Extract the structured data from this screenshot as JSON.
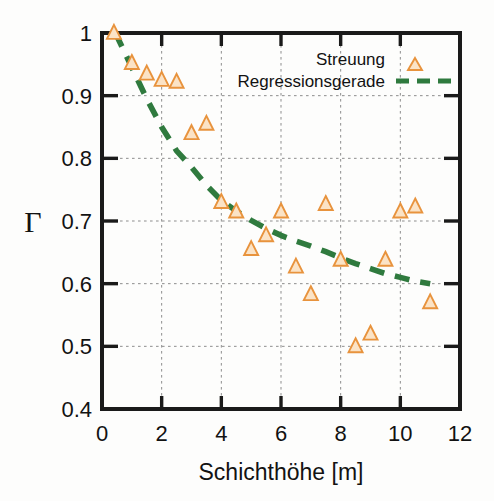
{
  "chart_data": {
    "type": "scatter",
    "title": "",
    "xlabel": "Schichthöhe [m]",
    "ylabel": "Γ",
    "xlim": [
      0,
      12
    ],
    "ylim": [
      0.4,
      1.0
    ],
    "xticks": [
      "0",
      "2",
      "4",
      "6",
      "8",
      "10",
      "12"
    ],
    "xtick_values": [
      0,
      2,
      4,
      6,
      8,
      10,
      12
    ],
    "yticks": [
      "0.4",
      "0.5",
      "0.6",
      "0.7",
      "0.8",
      "0.9",
      "1"
    ],
    "ytick_values": [
      0.4,
      0.5,
      0.6,
      0.7,
      0.8,
      0.9,
      1.0
    ],
    "grid": true,
    "grid_style": "dotted",
    "legend_position": "top-right",
    "series": [
      {
        "name": "Streuung",
        "type": "scatter",
        "marker": "triangle-up",
        "color": "#e8933d",
        "fill": "#fbe3c6",
        "points": [
          {
            "x": 0.4,
            "y": 1.0
          },
          {
            "x": 1.0,
            "y": 0.952
          },
          {
            "x": 1.5,
            "y": 0.935
          },
          {
            "x": 2.0,
            "y": 0.925
          },
          {
            "x": 2.5,
            "y": 0.922
          },
          {
            "x": 3.0,
            "y": 0.84
          },
          {
            "x": 3.5,
            "y": 0.855
          },
          {
            "x": 4.0,
            "y": 0.73
          },
          {
            "x": 4.5,
            "y": 0.715
          },
          {
            "x": 5.0,
            "y": 0.655
          },
          {
            "x": 5.5,
            "y": 0.677
          },
          {
            "x": 6.0,
            "y": 0.715
          },
          {
            "x": 6.5,
            "y": 0.627
          },
          {
            "x": 7.0,
            "y": 0.583
          },
          {
            "x": 7.5,
            "y": 0.727
          },
          {
            "x": 8.0,
            "y": 0.638
          },
          {
            "x": 8.5,
            "y": 0.5
          },
          {
            "x": 9.0,
            "y": 0.52
          },
          {
            "x": 9.5,
            "y": 0.638
          },
          {
            "x": 10.0,
            "y": 0.715
          },
          {
            "x": 10.5,
            "y": 0.723
          },
          {
            "x": 11.0,
            "y": 0.57
          }
        ]
      },
      {
        "name": "Regressionsgerade",
        "type": "line",
        "style": "dashed",
        "color": "#2f7a3e",
        "points": [
          {
            "x": 0.45,
            "y": 1.0
          },
          {
            "x": 1.0,
            "y": 0.945
          },
          {
            "x": 1.5,
            "y": 0.895
          },
          {
            "x": 2.0,
            "y": 0.85
          },
          {
            "x": 2.5,
            "y": 0.812
          },
          {
            "x": 3.0,
            "y": 0.786
          },
          {
            "x": 3.5,
            "y": 0.757
          },
          {
            "x": 4.0,
            "y": 0.733
          },
          {
            "x": 4.5,
            "y": 0.716
          },
          {
            "x": 5.0,
            "y": 0.701
          },
          {
            "x": 5.5,
            "y": 0.688
          },
          {
            "x": 6.0,
            "y": 0.677
          },
          {
            "x": 6.5,
            "y": 0.668
          },
          {
            "x": 7.0,
            "y": 0.66
          },
          {
            "x": 7.5,
            "y": 0.651
          },
          {
            "x": 8.0,
            "y": 0.641
          },
          {
            "x": 8.5,
            "y": 0.632
          },
          {
            "x": 9.0,
            "y": 0.624
          },
          {
            "x": 9.5,
            "y": 0.616
          },
          {
            "x": 10.0,
            "y": 0.61
          },
          {
            "x": 10.5,
            "y": 0.604
          },
          {
            "x": 11.0,
            "y": 0.6
          }
        ]
      }
    ]
  },
  "legend": {
    "entries": [
      {
        "label": "Streuung",
        "marker": "triangle-up"
      },
      {
        "label": "Regressionsgerade",
        "marker": "dashed-line"
      }
    ]
  },
  "colors": {
    "marker_stroke": "#e8933d",
    "marker_fill": "#fbe3c6",
    "regression": "#2f7a3e",
    "axis": "#1a1a1a",
    "grid": "#8d8d8d",
    "background": "#fdfdfc"
  }
}
